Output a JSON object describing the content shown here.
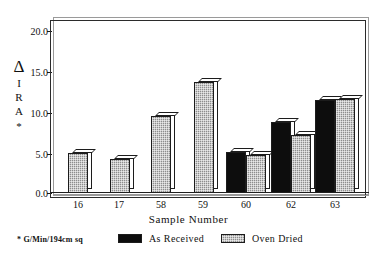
{
  "chart_data": {
    "type": "bar",
    "title": "",
    "subtitle": "",
    "xlabel": "Sample Number",
    "ylabel": "Δ I R A *",
    "ylabel_chars": [
      "Δ",
      "I",
      "R",
      "A",
      "*"
    ],
    "categories": [
      "16",
      "17",
      "58",
      "59",
      "60",
      "62",
      "63"
    ],
    "series": [
      {
        "name": "As Received",
        "color": "#0d0d0d",
        "values": [
          null,
          null,
          null,
          null,
          5.2,
          9.1,
          11.9
        ]
      },
      {
        "name": "Oven Dried",
        "color": "#8d8d8d",
        "values": [
          5.1,
          4.3,
          9.9,
          14.2,
          4.9,
          7.4,
          12.0
        ]
      }
    ],
    "ylim": [
      0.0,
      22.0
    ],
    "ytick_values": [
      0.0,
      5.0,
      10.0,
      15.0,
      20.0
    ],
    "ytick_labels": [
      "0.0",
      "5.0",
      "10.0",
      "15.0",
      "20.0"
    ],
    "grid": false,
    "legend_position": "below-plot",
    "footnote": "* G/Min/194cm sq"
  },
  "axes": {
    "y_title_stack": [
      "Δ",
      "I",
      "R",
      "A",
      "*"
    ],
    "x_title": "Sample Number",
    "y_ticks": [
      "0.0",
      "5.0",
      "10.0",
      "15.0",
      "20.0"
    ],
    "x_ticks": [
      "16",
      "17",
      "58",
      "59",
      "60",
      "62",
      "63"
    ]
  },
  "legend": {
    "note": "* G/Min/194cm sq",
    "items": [
      {
        "label": "As Received",
        "swatch": "solid-black-swatch"
      },
      {
        "label": "Oven Dried",
        "swatch": "hatched-gray-swatch"
      }
    ]
  },
  "colors": {
    "as_received": "#0d0d0d",
    "oven_dried": "#8d8d8d",
    "axis": "#1c1c1c",
    "frame_shadow": "#9a9a9a",
    "background": "#ffffff"
  }
}
